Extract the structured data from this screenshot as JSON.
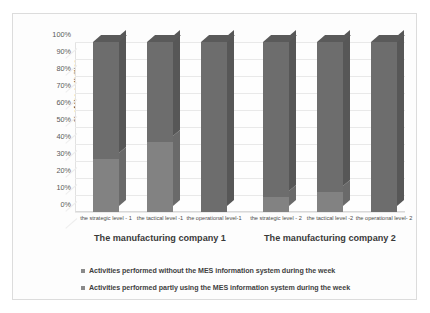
{
  "chart_data": {
    "type": "bar",
    "stacked": true,
    "title": "",
    "xlabel": "",
    "ylabel": "% of the activities",
    "ylim": [
      0,
      100
    ],
    "grid": true,
    "legend_position": "bottom",
    "categories": [
      "the strategic level - 1",
      "the tactical level -1",
      "the operational level-1",
      "the strategic level - 2",
      "the tactical level -2",
      "the operational level- 2"
    ],
    "groups": [
      {
        "label": "The manufacturing company 1",
        "categories": [
          0,
          1,
          2
        ]
      },
      {
        "label": "The manufacturing company 2",
        "categories": [
          3,
          4,
          5
        ]
      }
    ],
    "series": [
      {
        "name": "Activities performed without the MES information system during the week",
        "color": "#7f7f7f",
        "values": [
          31,
          41,
          0,
          9,
          12,
          0
        ]
      },
      {
        "name": "Activities performed partly using the MES information system during the week",
        "color": "#6e6e6e",
        "values": [
          69,
          59,
          100,
          91,
          88,
          100
        ]
      },
      {
        "name": "Activities performed completely using the MES information system during the week",
        "color": "#9a9a9a",
        "values": [
          0,
          0,
          0,
          0,
          0,
          0
        ]
      }
    ],
    "y_ticks": [
      "100%",
      "90%",
      "80%",
      "70%",
      "60%",
      "50%",
      "40%",
      "30%",
      "20%",
      "10%",
      "0%"
    ],
    "y_tick_values": [
      100,
      90,
      80,
      70,
      60,
      50,
      40,
      30,
      20,
      10,
      0
    ]
  },
  "axis": {
    "y_title": "% of the activities"
  },
  "legend": {
    "items": [
      {
        "marker": "legend-swatch",
        "label": "Activities performed without the MES information system during the week",
        "color": "#8a8a8a"
      },
      {
        "marker": "legend-swatch",
        "label": "Activities performed partly using the MES information system during the week",
        "color": "#8a8a8a"
      },
      {
        "marker": "legend-swatch",
        "label": "Activities performed completely using the MES information system during the week",
        "color": "#8a8a8a"
      }
    ]
  },
  "colors": {
    "bar_front_light": "#828282",
    "bar_front_dark": "#6d6d6d",
    "bar_side_light": "#6a6a6a",
    "bar_side_dark": "#575757",
    "bar_top": "#5a5a5a",
    "gridline": "#e9e9e9",
    "frame_border": "#dcdcdc",
    "text": "#3a3a3a",
    "background": "#fdfdfd"
  }
}
